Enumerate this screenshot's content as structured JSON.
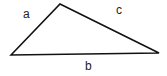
{
  "diagram": {
    "type": "triangle",
    "vertices": [
      [
        11,
        55
      ],
      [
        60,
        4
      ],
      [
        159,
        53
      ]
    ],
    "stroke_color": "#111111",
    "labels": {
      "a": "a",
      "b": "b",
      "c": "c"
    }
  }
}
